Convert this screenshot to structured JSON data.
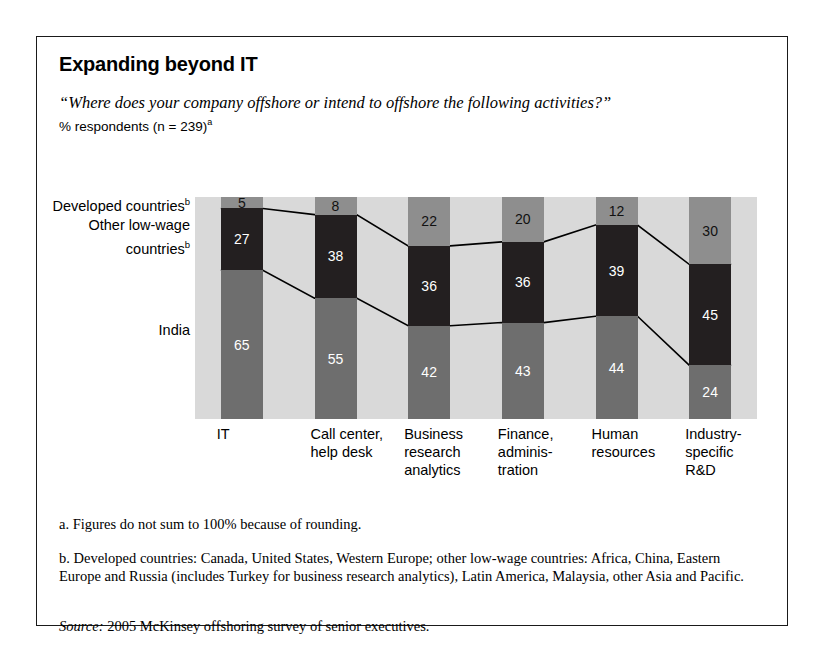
{
  "exhibit": {
    "title": "Expanding beyond IT",
    "question": "“Where does your company offshore or intend to offshore the following activities?”",
    "subnote_text": "% respondents (n = 239)",
    "subnote_marker": "a"
  },
  "series_labels": {
    "developed_line1": "Developed countries",
    "developed_marker": "b",
    "lowwage_line1": "Other low-wage",
    "lowwage_line2": "countries",
    "lowwage_marker": "b",
    "india": "India"
  },
  "footnotes": {
    "a": "a. Figures do not sum to 100% because of rounding.",
    "b": "b. Developed countries: Canada, United States, Western Europe; other low-wage countries: Africa, China, Eastern Europe and Russia (includes Turkey for business research analytics), Latin America, Malaysia, other Asia and Pacific.",
    "source_label": "Source:",
    "source_text": "2005 McKinsey offshoring survey of senior executives."
  },
  "colors": {
    "developed": "#8e8e8e",
    "lowwage": "#231f20",
    "india": "#6e6e6e",
    "plot_background": "#d9d9d9",
    "border": "#1a1a1a"
  },
  "chart_data": {
    "type": "bar",
    "stacked": true,
    "title": "Expanding beyond IT",
    "subtitle": "“Where does your company offshore or intend to offshore the following activities?”",
    "xlabel": "",
    "ylabel": "% respondents",
    "ylim": [
      0,
      100
    ],
    "grid": false,
    "legend_position": "left-axis-labels",
    "categories": [
      "IT",
      "Call center, help desk",
      "Business research analytics",
      "Finance, administration",
      "Human resources",
      "Industry-specific R&D"
    ],
    "category_lines": [
      [
        "IT"
      ],
      [
        "Call center,",
        "help desk"
      ],
      [
        "Business",
        "research",
        "analytics"
      ],
      [
        "Finance,",
        "adminis-",
        "tration"
      ],
      [
        "Human",
        "resources"
      ],
      [
        "Industry-",
        "specific",
        "R&D"
      ]
    ],
    "series": [
      {
        "name": "Developed countries",
        "values": [
          5,
          8,
          22,
          20,
          12,
          30
        ]
      },
      {
        "name": "Other low-wage countries",
        "values": [
          27,
          38,
          36,
          36,
          39,
          45
        ]
      },
      {
        "name": "India",
        "values": [
          65,
          55,
          42,
          43,
          44,
          24
        ]
      }
    ],
    "annotations": [
      "Figures do not sum to 100% because of rounding.",
      "Connector lines join the segment boundaries between adjacent bars."
    ]
  }
}
